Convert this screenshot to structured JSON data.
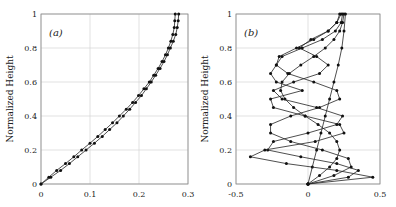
{
  "chart_data": [
    {
      "type": "line",
      "panel_label": "(a)",
      "xlabel": "",
      "ylabel": "Normalized Height",
      "xlim": [
        0,
        0.3
      ],
      "ylim": [
        0,
        1
      ],
      "xticks": [
        "0",
        "0.1",
        "0.2",
        "0.3"
      ],
      "yticks": [
        "0",
        "0.2",
        "0.4",
        "0.6",
        "0.8",
        "1"
      ],
      "grid": true,
      "markers": true,
      "series": [
        {
          "name": "curve-1",
          "y": [
            0,
            0.04,
            0.08,
            0.12,
            0.16,
            0.2,
            0.24,
            0.28,
            0.32,
            0.36,
            0.4,
            0.44,
            0.48,
            0.52,
            0.56,
            0.6,
            0.64,
            0.68,
            0.72,
            0.76,
            0.8,
            0.84,
            0.88,
            0.92,
            0.96,
            1.0
          ],
          "x": [
            0,
            0.016,
            0.032,
            0.05,
            0.067,
            0.083,
            0.1,
            0.116,
            0.131,
            0.146,
            0.16,
            0.174,
            0.187,
            0.199,
            0.21,
            0.221,
            0.23,
            0.239,
            0.247,
            0.254,
            0.26,
            0.265,
            0.269,
            0.272,
            0.273,
            0.274
          ]
        },
        {
          "name": "curve-2",
          "y": [
            0,
            0.04,
            0.08,
            0.12,
            0.16,
            0.2,
            0.24,
            0.28,
            0.32,
            0.36,
            0.4,
            0.44,
            0.48,
            0.52,
            0.56,
            0.6,
            0.64,
            0.68,
            0.72,
            0.76,
            0.8,
            0.84,
            0.88,
            0.92,
            0.96,
            1.0
          ],
          "x": [
            0,
            0.02,
            0.04,
            0.058,
            0.075,
            0.092,
            0.109,
            0.125,
            0.14,
            0.155,
            0.168,
            0.181,
            0.193,
            0.205,
            0.215,
            0.225,
            0.234,
            0.243,
            0.251,
            0.258,
            0.264,
            0.27,
            0.275,
            0.278,
            0.28,
            0.281
          ]
        }
      ]
    },
    {
      "type": "line",
      "panel_label": "(b)",
      "xlabel": "",
      "ylabel": "Normalized Height",
      "xlim": [
        -0.5,
        0.5
      ],
      "ylim": [
        0,
        1
      ],
      "xticks": [
        "-0.5",
        "0",
        "0.5"
      ],
      "yticks": [
        "0",
        "0.2",
        "0.4",
        "0.6",
        "0.8",
        "1"
      ],
      "grid": true,
      "markers": true,
      "series": [
        {
          "name": "mode-1",
          "y": [
            0,
            0.1,
            0.2,
            0.3,
            0.4,
            0.5,
            0.6,
            0.7,
            0.8,
            0.9,
            1.0
          ],
          "x": [
            0,
            0.03,
            0.06,
            0.09,
            0.12,
            0.15,
            0.18,
            0.21,
            0.235,
            0.25,
            0.26
          ]
        },
        {
          "name": "mode-2",
          "y": [
            0,
            0.05,
            0.1,
            0.15,
            0.2,
            0.25,
            0.3,
            0.35,
            0.4,
            0.45,
            0.5,
            0.55,
            0.6,
            0.65,
            0.7,
            0.75,
            0.8,
            0.85,
            0.9,
            0.95,
            1.0
          ],
          "x": [
            0,
            0.08,
            0.15,
            0.2,
            0.22,
            0.2,
            0.15,
            0.07,
            -0.02,
            -0.1,
            -0.16,
            -0.19,
            -0.18,
            -0.13,
            -0.05,
            0.04,
            0.12,
            0.18,
            0.22,
            0.24,
            0.25
          ]
        },
        {
          "name": "mode-3",
          "y": [
            0,
            0.05,
            0.1,
            0.15,
            0.2,
            0.25,
            0.3,
            0.35,
            0.4,
            0.45,
            0.5,
            0.55,
            0.6,
            0.65,
            0.7,
            0.75,
            0.8,
            0.85,
            0.9,
            0.95,
            1.0
          ],
          "x": [
            0,
            0.18,
            0.3,
            0.28,
            0.1,
            -0.12,
            -0.26,
            -0.26,
            -0.12,
            0.08,
            0.22,
            0.2,
            0.04,
            -0.14,
            -0.22,
            -0.18,
            -0.04,
            0.1,
            0.19,
            0.23,
            0.24
          ]
        },
        {
          "name": "mode-4",
          "y": [
            0,
            0.04,
            0.08,
            0.12,
            0.16,
            0.2,
            0.25,
            0.3,
            0.35,
            0.4,
            0.45,
            0.5,
            0.55,
            0.6,
            0.65,
            0.7,
            0.75,
            0.8,
            0.85,
            0.9,
            0.95,
            1.0
          ],
          "x": [
            0,
            0.28,
            0.35,
            0.2,
            -0.05,
            -0.28,
            -0.24,
            0.0,
            0.2,
            0.24,
            0.06,
            -0.18,
            -0.24,
            -0.1,
            0.08,
            0.14,
            0.06,
            -0.06,
            0.02,
            0.14,
            0.2,
            0.23
          ]
        },
        {
          "name": "mode-5",
          "y": [
            0,
            0.04,
            0.08,
            0.12,
            0.16,
            0.2,
            0.25,
            0.3,
            0.35,
            0.4,
            0.45,
            0.5,
            0.55,
            0.6,
            0.65,
            0.7,
            0.75,
            0.8,
            0.85,
            0.9,
            0.95,
            1.0
          ],
          "x": [
            0,
            0.45,
            0.2,
            -0.15,
            -0.4,
            -0.3,
            0.05,
            0.25,
            0.22,
            -0.02,
            -0.24,
            -0.26,
            -0.04,
            -0.22,
            -0.26,
            -0.22,
            -0.2,
            -0.08,
            0.04,
            0.14,
            0.2,
            0.22
          ]
        }
      ]
    }
  ]
}
